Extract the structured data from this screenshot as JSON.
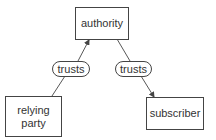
{
  "diagram": {
    "nodes": {
      "authority": {
        "label": "authority"
      },
      "relying_party": {
        "label": "relying\nparty"
      },
      "subscriber": {
        "label": "subscriber"
      }
    },
    "edges": [
      {
        "from": "relying party",
        "to": "authority",
        "label": "trusts"
      },
      {
        "from": "authority",
        "to": "subscriber",
        "label": "trusts"
      }
    ],
    "colors": {
      "stroke": "#444444",
      "text": "#333333",
      "background": "#ffffff"
    }
  }
}
